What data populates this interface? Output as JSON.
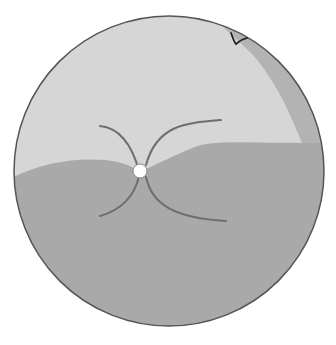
{
  "diagram": {
    "type": "fundus-illustration",
    "labels": [
      {
        "id": "mark",
        "text": "V"
      }
    ],
    "colors": {
      "background": "#ffffff",
      "upper_region": "#d6d6d6",
      "lower_region": "#a9a9a9",
      "band": "#b3b3b3",
      "outline": "#555555",
      "vessel": "#6e6e6e",
      "disc": "#ffffff"
    }
  }
}
